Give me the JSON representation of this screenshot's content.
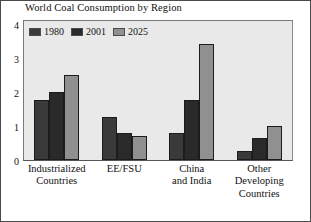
{
  "chart_data": {
    "type": "bar",
    "title": "World Coal Consumption by Region",
    "xlabel": "",
    "ylabel": "",
    "ylim": [
      0,
      4
    ],
    "yticks": [
      0,
      1,
      2,
      3,
      4
    ],
    "grid": false,
    "legend_position": "top-left-inside",
    "categories": [
      "Industrialized\nCountries",
      "EE/FSU",
      "China\nand India",
      "Other\nDeveloping\nCountries"
    ],
    "series": [
      {
        "name": "1980",
        "color": "#3a3a3a",
        "values": [
          1.75,
          1.25,
          0.8,
          0.25
        ]
      },
      {
        "name": "2001",
        "color": "#2a2a2a",
        "values": [
          2.0,
          0.8,
          1.75,
          0.65
        ]
      },
      {
        "name": "2025",
        "color": "#909090",
        "values": [
          2.5,
          0.7,
          3.4,
          1.0
        ]
      }
    ]
  },
  "colors": {
    "plot_background": "#e9e9e9",
    "figure_background": "#ffffff",
    "frame": "#4a4a4a",
    "bar_outline": "#1c1c1c"
  }
}
